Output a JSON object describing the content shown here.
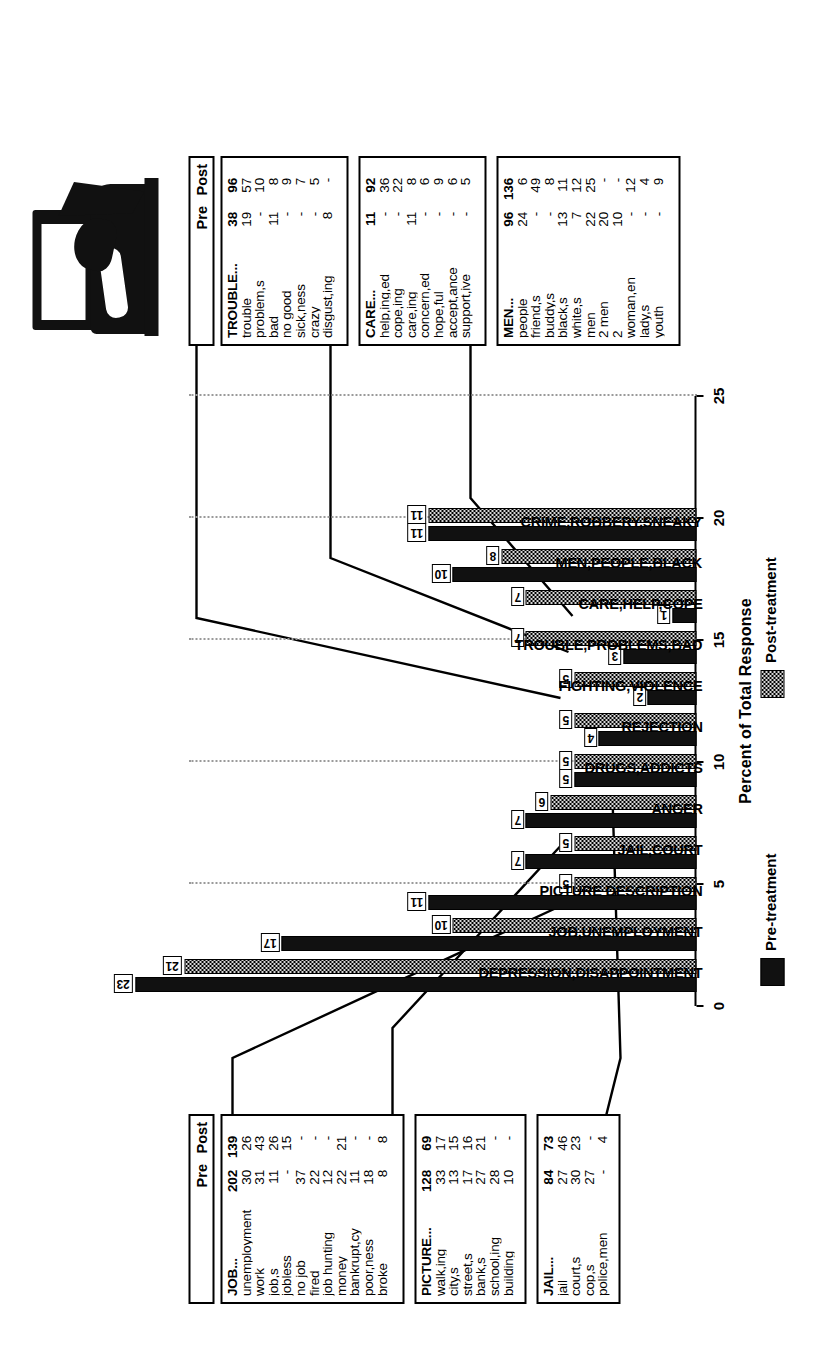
{
  "figure": {
    "xlabel": "Percent of Total Response",
    "legend": [
      {
        "key": "pre",
        "label": "Pre-treatment"
      },
      {
        "key": "post",
        "label": "Post-treatment"
      }
    ],
    "thumbnail_alt": "halftone-photograph-tv-and-figure"
  },
  "chart_data": {
    "type": "bar",
    "title": "",
    "xlabel": "Percent of Total Response",
    "ylabel": "",
    "xlim": [
      0,
      25
    ],
    "xticks": [
      0,
      5,
      10,
      15,
      20,
      25
    ],
    "grid": true,
    "legend_position": "below-axis",
    "categories": [
      "DEPRESSION,DISAPPOINTMENT",
      "JOB,UNEMPLOYMENT",
      "PICTURE DESCRIPTION",
      "JAIL,COURT",
      "ANGER",
      "DRUGS,ADDICTS",
      "REJECTION",
      "FIGHTING,VIOLENCE",
      "TROUBLE,PROBLEMS,BAD",
      "CARE,HELP,COPE",
      "MEN,PEOPLE,BLACK",
      "CRIME,ROBBERY,SNEAKY"
    ],
    "series": [
      {
        "name": "Pre-treatment",
        "values": [
          23,
          17,
          11,
          7,
          7,
          5,
          4,
          2,
          3,
          1,
          10,
          11
        ]
      },
      {
        "name": "Post-treatment",
        "values": [
          21,
          10,
          5,
          5,
          6,
          5,
          5,
          5,
          7,
          7,
          8,
          11
        ]
      }
    ]
  },
  "tables": {
    "header": {
      "pre": "Pre",
      "post": "Post"
    },
    "trouble": {
      "rows": [
        {
          "label": "TROUBLE...",
          "pre": "38",
          "post": "96"
        },
        {
          "label": "trouble",
          "pre": "19",
          "post": "57"
        },
        {
          "label": "problem,s",
          "pre": "-",
          "post": "10"
        },
        {
          "label": "bad",
          "pre": "11",
          "post": "8"
        },
        {
          "label": "no good",
          "pre": "-",
          "post": "9"
        },
        {
          "label": "sick,ness",
          "pre": "-",
          "post": "7"
        },
        {
          "label": "crazy",
          "pre": "-",
          "post": "5"
        },
        {
          "label": "disgust,ing",
          "pre": "8",
          "post": "-"
        }
      ]
    },
    "care": {
      "rows": [
        {
          "label": "CARE...",
          "pre": "11",
          "post": "92"
        },
        {
          "label": "help,ing,ed",
          "pre": "-",
          "post": "36"
        },
        {
          "label": "cope,ing",
          "pre": "-",
          "post": "22"
        },
        {
          "label": "care,ing",
          "pre": "11",
          "post": "8"
        },
        {
          "label": "concern,ed",
          "pre": "-",
          "post": "6"
        },
        {
          "label": "hope,ful",
          "pre": "-",
          "post": "9"
        },
        {
          "label": "accept,ance",
          "pre": "-",
          "post": "6"
        },
        {
          "label": "support,ive",
          "pre": "-",
          "post": "5"
        }
      ]
    },
    "men": {
      "rows": [
        {
          "label": "MEN...",
          "pre": "96",
          "post": "136"
        },
        {
          "label": "people",
          "pre": "24",
          "post": "6"
        },
        {
          "label": "friend,s",
          "pre": "-",
          "post": "49"
        },
        {
          "label": "buddy,s",
          "pre": "-",
          "post": "8"
        },
        {
          "label": "black,s",
          "pre": "13",
          "post": "11"
        },
        {
          "label": "white,s",
          "pre": "7",
          "post": "12"
        },
        {
          "label": "men",
          "pre": "22",
          "post": "25"
        },
        {
          "label": "2 men",
          "pre": "20",
          "post": "-"
        },
        {
          "label": "2",
          "pre": "10",
          "post": "-"
        },
        {
          "label": "woman,en",
          "pre": "-",
          "post": "12"
        },
        {
          "label": "lady,s",
          "pre": "-",
          "post": "4"
        },
        {
          "label": "youth",
          "pre": "-",
          "post": "9"
        }
      ]
    },
    "job": {
      "rows": [
        {
          "label": "JOB...",
          "pre": "202",
          "post": "139"
        },
        {
          "label": "unemployment",
          "pre": "30",
          "post": "26"
        },
        {
          "label": "work",
          "pre": "31",
          "post": "43"
        },
        {
          "label": "job,s",
          "pre": "11",
          "post": "26"
        },
        {
          "label": "jobless",
          "pre": "-",
          "post": "15"
        },
        {
          "label": "no job",
          "pre": "37",
          "post": "-"
        },
        {
          "label": "fired",
          "pre": "22",
          "post": "-"
        },
        {
          "label": "job hunting",
          "pre": "12",
          "post": "-"
        },
        {
          "label": "money",
          "pre": "22",
          "post": "21"
        },
        {
          "label": "bankrupt,cy",
          "pre": "11",
          "post": "-"
        },
        {
          "label": "poor,ness",
          "pre": "18",
          "post": "-"
        },
        {
          "label": "broke",
          "pre": "8",
          "post": "8"
        }
      ]
    },
    "picture": {
      "rows": [
        {
          "label": "PICTURE...",
          "pre": "128",
          "post": "69"
        },
        {
          "label": "walk,ing",
          "pre": "33",
          "post": "17"
        },
        {
          "label": "city,s",
          "pre": "13",
          "post": "15"
        },
        {
          "label": "street,s",
          "pre": "17",
          "post": "16"
        },
        {
          "label": "bank,s",
          "pre": "27",
          "post": "21"
        },
        {
          "label": "school,ing",
          "pre": "28",
          "post": "-"
        },
        {
          "label": "building",
          "pre": "10",
          "post": "-"
        }
      ]
    },
    "jail": {
      "rows": [
        {
          "label": "JAIL...",
          "pre": "84",
          "post": "73"
        },
        {
          "label": "jail",
          "pre": "27",
          "post": "46"
        },
        {
          "label": "court,s",
          "pre": "30",
          "post": "23"
        },
        {
          "label": "cop,s",
          "pre": "27",
          "post": "-"
        },
        {
          "label": "police,men",
          "pre": "-",
          "post": "4"
        }
      ]
    }
  }
}
